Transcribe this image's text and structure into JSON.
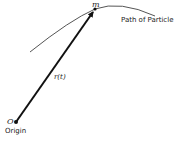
{
  "diagram": {
    "particle_label": "m",
    "path_label": "Path of Particle",
    "vector_label": "r(t)",
    "origin_point_label": "O",
    "origin_label": "Origin",
    "colors": {
      "stroke": "#111111",
      "curve": "#555555",
      "text": "#222222"
    }
  }
}
